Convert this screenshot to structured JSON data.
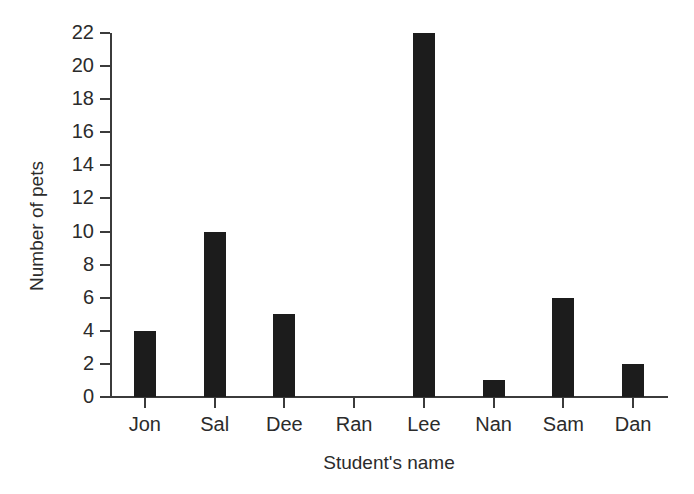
{
  "chart_data": {
    "type": "bar",
    "title": "",
    "xlabel": "Student's name",
    "ylabel": "Number of pets",
    "categories": [
      "Jon",
      "Sal",
      "Dee",
      "Ran",
      "Lee",
      "Nan",
      "Sam",
      "Dan"
    ],
    "values": [
      4,
      10,
      5,
      0,
      22,
      1,
      6,
      2
    ],
    "ylim": [
      0,
      22
    ],
    "ytick_step": 2,
    "ytick_labels": [
      "0",
      "2",
      "4",
      "6",
      "8",
      "10",
      "12",
      "14",
      "16",
      "18",
      "20",
      "22"
    ],
    "ytick_values": [
      0,
      2,
      4,
      6,
      8,
      10,
      12,
      14,
      16,
      18,
      20,
      22
    ],
    "grid": false,
    "legend": false,
    "bar_color": "#1c1c1c",
    "axis_color": "#3b3b3b",
    "text_color": "#2b2b2b",
    "background_color": "#ffffff"
  }
}
